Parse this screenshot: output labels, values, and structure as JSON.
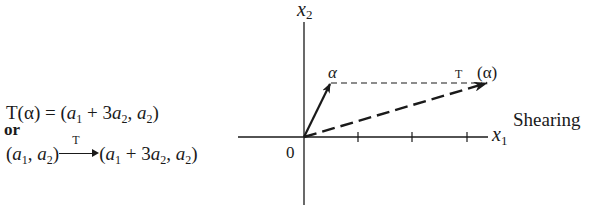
{
  "equations": {
    "line1": {
      "lhs_T": "T",
      "lhs_arg": "(α)",
      "equals": "=",
      "rhs_open": "(",
      "a": "a",
      "sub1": "1",
      "plus3": " + 3",
      "sub2": "2",
      "comma": ", ",
      "rhs_close": ")"
    },
    "or": "or",
    "line3": {
      "open": "(",
      "a": "a",
      "sub1": "1",
      "comma": ", ",
      "sub2": "2",
      "close": ")",
      "arrow_label": "T",
      "plus3": " + 3"
    }
  },
  "diagram": {
    "axis_x_label": "x",
    "axis_x_sub": "1",
    "axis_y_label": "x",
    "axis_y_sub": "2",
    "origin_label": "0",
    "alpha_label": "α",
    "image_label_T": "T",
    "image_label_arg": "(α)",
    "caption": "Shearing",
    "origin_px": [
      304,
      137
    ],
    "tick_x_px": [
      358,
      412,
      467
    ],
    "alpha_tip_px": [
      330,
      83
    ],
    "image_tip_px": [
      488,
      83
    ],
    "color": "#1a1a1a"
  }
}
